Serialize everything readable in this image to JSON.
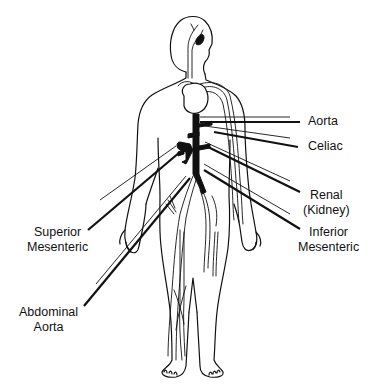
{
  "diagram": {
    "labels": {
      "aorta": {
        "lines": [
          "Aorta"
        ]
      },
      "celiac": {
        "lines": [
          "Celiac"
        ]
      },
      "renal": {
        "lines": [
          "Renal",
          "(Kidney)"
        ]
      },
      "inferior_mesenteric": {
        "lines": [
          "Inferior",
          "Mesenteric"
        ]
      },
      "superior_mesenteric": {
        "lines": [
          "Superior",
          "Mesenteric"
        ]
      },
      "abdominal_aorta": {
        "lines": [
          "Abdominal",
          "Aorta"
        ]
      }
    },
    "colors": {
      "line": "#111111",
      "background": "#ffffff"
    }
  }
}
